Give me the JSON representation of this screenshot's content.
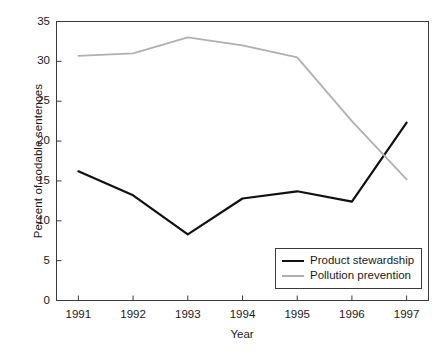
{
  "chart_data": {
    "type": "line",
    "title": "",
    "xlabel": "Year",
    "ylabel": "Percent of codable sentences",
    "categories": [
      "1991",
      "1992",
      "1993",
      "1994",
      "1995",
      "1996",
      "1997"
    ],
    "x": [
      1991,
      1992,
      1993,
      1994,
      1995,
      1996,
      1997
    ],
    "xlim": [
      1990.6,
      1997.4
    ],
    "ylim": [
      0,
      35
    ],
    "yticks": [
      0,
      5,
      10,
      15,
      20,
      25,
      30,
      35
    ],
    "ytick_labels": [
      "0",
      "5",
      "10",
      "15",
      "20",
      "25",
      "30",
      "35"
    ],
    "grid": false,
    "legend_position": "lower right",
    "series": [
      {
        "name": "Product stewardship",
        "color": "#111111",
        "width": 2.2,
        "values": [
          16.2,
          13.2,
          8.3,
          12.8,
          13.7,
          12.4,
          22.3
        ]
      },
      {
        "name": "Pollution prevention",
        "color": "#b0b0b0",
        "width": 1.8,
        "values": [
          30.7,
          31.0,
          33.0,
          32.0,
          30.5,
          22.5,
          15.2
        ]
      }
    ]
  },
  "legend": {
    "entries": [
      {
        "label": "Product stewardship"
      },
      {
        "label": "Pollution prevention"
      }
    ]
  },
  "axes": {
    "frame_color": "#3a3a3a"
  }
}
